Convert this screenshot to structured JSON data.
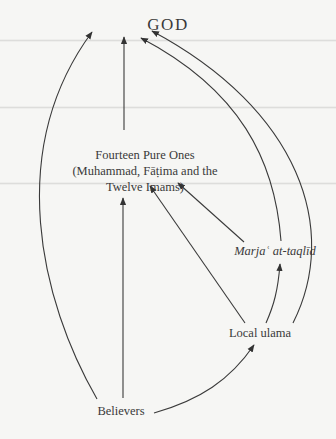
{
  "diagram": {
    "type": "hierarchy-flow",
    "nodes": {
      "god": {
        "label": "GOD"
      },
      "fourteen_pure_ones": {
        "lines": [
          "Fourteen Pure Ones",
          "(Muhammad, Fāṭima and the",
          "Twelve Imams)"
        ]
      },
      "marja": {
        "label": "Marjaʿ at-taqlīd",
        "style": "italic"
      },
      "local_ulama": {
        "label": "Local ulama"
      },
      "believers": {
        "label": "Believers"
      }
    },
    "edges": [
      {
        "from": "Believers",
        "to": "GOD"
      },
      {
        "from": "Believers",
        "to": "Fourteen Pure Ones"
      },
      {
        "from": "Believers",
        "to": "Local ulama"
      },
      {
        "from": "Fourteen Pure Ones",
        "to": "GOD"
      },
      {
        "from": "Local ulama",
        "to": "Fourteen Pure Ones"
      },
      {
        "from": "Local ulama",
        "to": "Marjaʿ at-taqlīd"
      },
      {
        "from": "Local ulama",
        "to": "GOD"
      },
      {
        "from": "Marjaʿ at-taqlīd",
        "to": "Fourteen Pure Ones"
      },
      {
        "from": "Marjaʿ at-taqlīd",
        "to": "GOD"
      }
    ],
    "colors": {
      "background": "#f6f6f4",
      "ink": "#3a3a3a"
    }
  }
}
